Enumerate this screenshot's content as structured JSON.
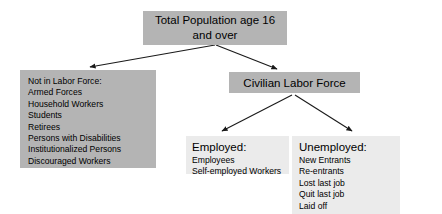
{
  "diagram": {
    "type": "flowchart",
    "orientation": "top-down",
    "nodes": {
      "total_population": {
        "label_line1": "Total Population age 16",
        "label_line2": "and over"
      },
      "not_in_labor_force": {
        "heading": "Not in Labor Force:",
        "items": [
          "Armed Forces",
          "Household Workers",
          "Students",
          "Retirees",
          "Persons with Disabilities",
          "Institutionalized Persons",
          "Discouraged Workers"
        ]
      },
      "civilian_labor_force": {
        "label": "Civilian Labor Force"
      },
      "employed": {
        "heading": "Employed:",
        "items": [
          "Employees",
          "Self-employed Workers"
        ]
      },
      "unemployed": {
        "heading": "Unemployed:",
        "items": [
          "New Entrants",
          "Re-entrants",
          "Lost last job",
          "Quit last job",
          "Laid off"
        ]
      }
    },
    "edges": [
      {
        "from": "total_population",
        "to": "not_in_labor_force"
      },
      {
        "from": "total_population",
        "to": "civilian_labor_force"
      },
      {
        "from": "civilian_labor_force",
        "to": "employed"
      },
      {
        "from": "civilian_labor_force",
        "to": "unemployed"
      }
    ],
    "colors": {
      "box_fill_dark": "#b4b4b4",
      "box_fill_light": "#ebebeb",
      "arrow": "#1a1a1a",
      "text": "#000000",
      "background": "#ffffff"
    }
  }
}
